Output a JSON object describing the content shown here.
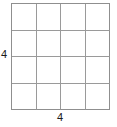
{
  "figure": {
    "type": "grid-diagram",
    "background_color": "#ffffff",
    "grid": {
      "columns": 4,
      "rows": 4,
      "cell_count": 16,
      "line_color": "#9a9a9a",
      "border_color": "#8f8f8f",
      "cells": [
        [
          " ",
          " ",
          " ",
          " "
        ],
        [
          " ",
          " ",
          " ",
          " "
        ],
        [
          " ",
          " ",
          " ",
          " "
        ],
        [
          " ",
          " ",
          " ",
          " "
        ]
      ]
    },
    "labels": {
      "left": "4",
      "bottom": "4",
      "text_color": "#1a1a1a"
    }
  },
  "chart_data": {
    "type": "table",
    "title": "",
    "xlabel": "4",
    "ylabel": "4",
    "categories": [
      "1",
      "2",
      "3",
      "4"
    ],
    "rows": [
      "1",
      "2",
      "3",
      "4"
    ],
    "values": [
      [
        0,
        0,
        0,
        0
      ],
      [
        0,
        0,
        0,
        0
      ],
      [
        0,
        0,
        0,
        0
      ],
      [
        0,
        0,
        0,
        0
      ]
    ],
    "annotations": [
      "4",
      "4"
    ],
    "grid": true,
    "legend": "none"
  }
}
